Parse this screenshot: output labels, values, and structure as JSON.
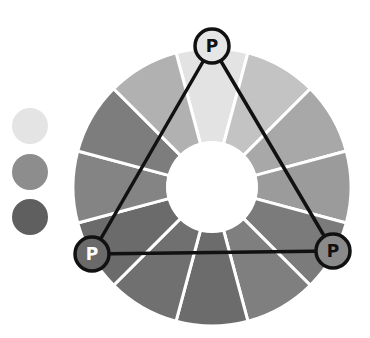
{
  "diagram": {
    "type": "triadic-color-wheel",
    "wheel": {
      "center": [
        212,
        187
      ],
      "outer_radius": 139,
      "inner_radius": 46,
      "segment_count": 12,
      "divider_color": "#ffffff",
      "segments": [
        {
          "index": 0,
          "angle": 0,
          "color": "#e3e3e3"
        },
        {
          "index": 1,
          "angle": 30,
          "color": "#c3c3c3"
        },
        {
          "index": 2,
          "angle": 60,
          "color": "#a8a8a8"
        },
        {
          "index": 3,
          "angle": 90,
          "color": "#9b9b9b"
        },
        {
          "index": 4,
          "angle": 120,
          "color": "#7b7b7b"
        },
        {
          "index": 5,
          "angle": 150,
          "color": "#7f7f7f"
        },
        {
          "index": 6,
          "angle": 180,
          "color": "#6c6c6c"
        },
        {
          "index": 7,
          "angle": 210,
          "color": "#707070"
        },
        {
          "index": 8,
          "angle": 240,
          "color": "#6b6b6b"
        },
        {
          "index": 9,
          "angle": 270,
          "color": "#848484"
        },
        {
          "index": 10,
          "angle": 300,
          "color": "#7d7d7d"
        },
        {
          "index": 11,
          "angle": 330,
          "color": "#b1b1b1"
        }
      ]
    },
    "triangle": {
      "stroke": "#111111",
      "stroke_width": 3.5,
      "vertices": [
        {
          "name": "top",
          "x": 212,
          "y": 46,
          "label": "P",
          "fill": "#e6e6e6",
          "text_color": "#111111"
        },
        {
          "name": "left",
          "x": 92,
          "y": 254,
          "label": "P",
          "fill": "#6a6a6a",
          "text_color": "#ffffff"
        },
        {
          "name": "right",
          "x": 333,
          "y": 251,
          "label": "P",
          "fill": "#8a8a8a",
          "text_color": "#111111"
        }
      ],
      "vertex_radius": 17
    },
    "legend_swatches": [
      {
        "name": "light",
        "color": "#e4e4e4",
        "top": 108
      },
      {
        "name": "medium",
        "color": "#8d8d8d",
        "top": 154
      },
      {
        "name": "dark",
        "color": "#5f5f5f",
        "top": 199
      }
    ]
  }
}
